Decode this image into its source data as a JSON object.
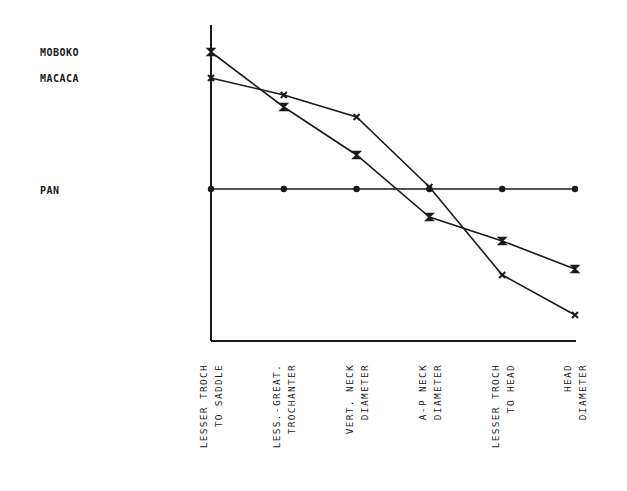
{
  "chart_data": {
    "type": "line",
    "title": "",
    "xlabel": "",
    "ylabel": "",
    "grid": false,
    "legend_position": "left (direct labels)",
    "baseline_series": "PAN",
    "units": "relative deviation from PAN (plot pixels above baseline)",
    "categories": [
      "LESSER TROCH TO SADDLE",
      "LESS.-GREAT. TROCHANTER",
      "VERT. NECK DIAMETER",
      "A-P NECK DIAMETER",
      "LESSER TROCH TO HEAD",
      "HEAD DIAMETER"
    ],
    "series": [
      {
        "name": "MOBOKO",
        "marker": "hourglass",
        "values": [
          137,
          82,
          34,
          -28,
          -52,
          -80
        ]
      },
      {
        "name": "MACACA",
        "marker": "x",
        "values": [
          111,
          94,
          72,
          2,
          -86,
          -126
        ]
      },
      {
        "name": "PAN",
        "marker": "dot",
        "values": [
          0,
          0,
          0,
          0,
          0,
          0
        ]
      }
    ],
    "ylim": [
      -152,
      164
    ]
  },
  "labels": {
    "series": [
      {
        "name": "MOBOKO",
        "y": 52
      },
      {
        "name": "MACACA",
        "y": 78
      },
      {
        "name": "PAN",
        "y": 190
      }
    ],
    "categories": [
      {
        "line1": "LESSER TROCH",
        "line2": "TO SADDLE"
      },
      {
        "line1": "LESS.-GREAT.",
        "line2": "TROCHANTER"
      },
      {
        "line1": "VERT. NECK",
        "line2": "DIAMETER"
      },
      {
        "line1": "A-P NECK",
        "line2": "DIAMETER"
      },
      {
        "line1": "LESSER TROCH",
        "line2": "TO HEAD"
      },
      {
        "line1": "HEAD",
        "line2": "DIAMETER"
      }
    ]
  },
  "colors": {
    "ink": "#1a1a1a",
    "background": "#ffffff"
  }
}
